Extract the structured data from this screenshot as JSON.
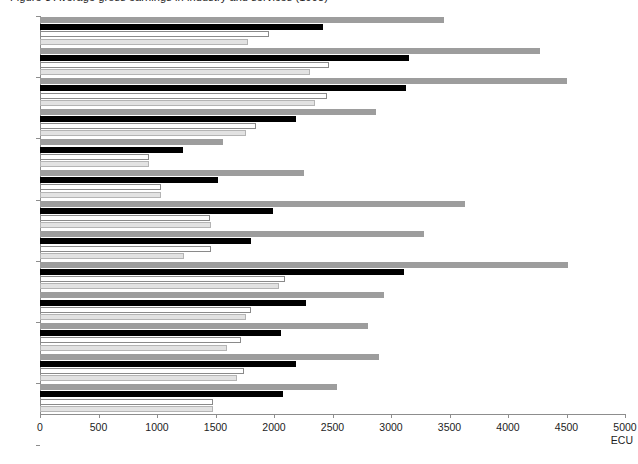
{
  "chart_title": "Figure 3  Average gross earnings in industry and services (1998)",
  "unit_label": "ECU",
  "axis": {
    "x_min": 0,
    "x_max": 5000,
    "x_step": 500,
    "x_ticks": [
      "0",
      "500",
      "1000",
      "1500",
      "2000",
      "2500",
      "3000",
      "3500",
      "4000",
      "4500",
      "5000"
    ]
  },
  "chart_data": {
    "type": "bar",
    "orientation": "horizontal",
    "title": "Figure 3  Average gross earnings in industry and services (1998)",
    "xlabel": "ECU",
    "ylabel": "",
    "xlim": [
      0,
      5000
    ],
    "grid": false,
    "legend": "none",
    "categories": [
      "B",
      "DK",
      "D¹",
      "D²",
      "EL",
      "E",
      "F",
      "I",
      "L",
      "NL",
      "FIN",
      "S",
      "UK"
    ],
    "series": [
      {
        "name": "series-1",
        "color": "#9d9d9d",
        "values": [
          3450,
          4270,
          4500,
          2870,
          1560,
          2260,
          3630,
          3280,
          4510,
          2940,
          2800,
          2900,
          2540
        ]
      },
      {
        "name": "series-2",
        "color": "#000000",
        "values": [
          2420,
          3150,
          3130,
          2190,
          1220,
          1520,
          1990,
          1800,
          3110,
          2270,
          2060,
          2190,
          2080
        ]
      },
      {
        "name": "series-3",
        "color": "#ffffff",
        "values": [
          1960,
          2470,
          2450,
          1850,
          930,
          1030,
          1450,
          1460,
          2090,
          1800,
          1720,
          1740,
          1480
        ]
      },
      {
        "name": "series-4",
        "color": "#e2e2e2",
        "values": [
          1780,
          2310,
          2350,
          1760,
          930,
          1030,
          1460,
          1230,
          2040,
          1760,
          1600,
          1680,
          1480
        ]
      }
    ]
  }
}
